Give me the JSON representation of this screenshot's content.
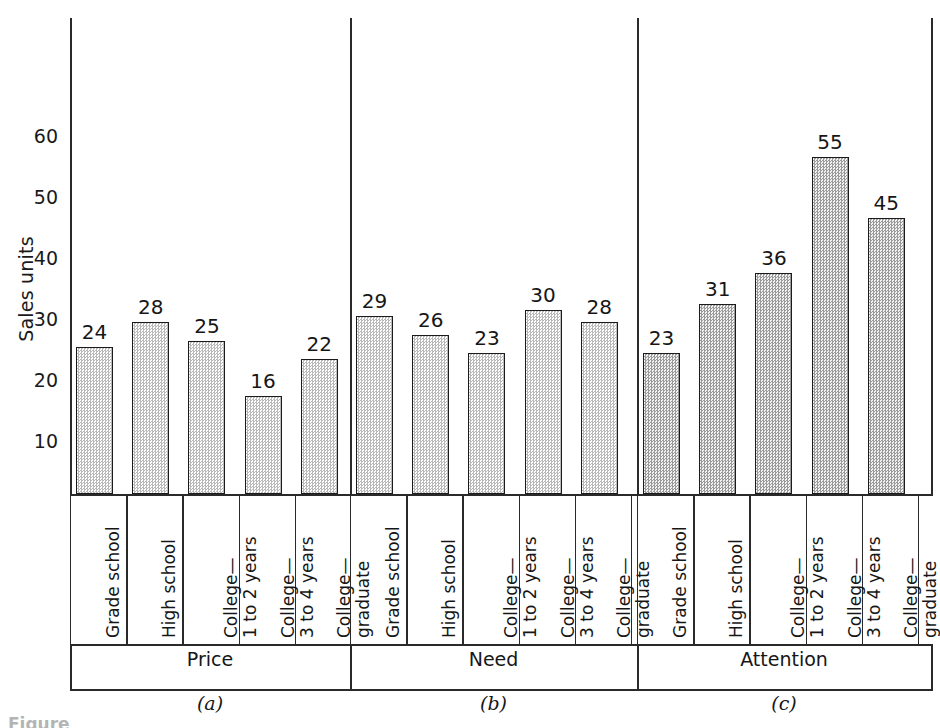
{
  "chart_data": {
    "type": "bar",
    "title": "",
    "xlabel": "",
    "ylabel": "Sales units",
    "ylim": [
      0,
      68
    ],
    "ytick_values": [
      10,
      20,
      30,
      40,
      50,
      60
    ],
    "ytick_labels": [
      "10",
      "20",
      "30",
      "40",
      "50",
      "60"
    ],
    "grid": false,
    "legend": "none",
    "value_labels": true,
    "categories": [
      "Grade school",
      "High school",
      "College— 1 to 2 years",
      "College— 3 to 4 years",
      "College— graduate"
    ],
    "panels": [
      {
        "tag": "(a)",
        "name": "Price",
        "values": [
          24,
          28,
          25,
          16,
          22
        ],
        "shade": "light"
      },
      {
        "tag": "(b)",
        "name": "Need",
        "values": [
          29,
          26,
          23,
          30,
          28
        ],
        "shade": "light"
      },
      {
        "tag": "(c)",
        "name": "Attention",
        "values": [
          23,
          31,
          36,
          55,
          45
        ],
        "shade": "dark"
      }
    ]
  },
  "axis": {
    "y_title": "Sales units",
    "ticks": [
      {
        "label": "60"
      },
      {
        "label": "50"
      },
      {
        "label": "40"
      },
      {
        "label": "30"
      },
      {
        "label": "20"
      },
      {
        "label": "10"
      }
    ]
  },
  "categories": [
    {
      "line1": "Grade school",
      "line2": ""
    },
    {
      "line1": "High school",
      "line2": ""
    },
    {
      "line1": "College—",
      "line2": "1 to 2 years"
    },
    {
      "line1": "College—",
      "line2": "3 to 4 years"
    },
    {
      "line1": "College—",
      "line2": "graduate"
    }
  ],
  "panels": [
    {
      "name": "Price",
      "tag": "(a)",
      "bars": [
        {
          "value": "24"
        },
        {
          "value": "28"
        },
        {
          "value": "25"
        },
        {
          "value": "16"
        },
        {
          "value": "22"
        }
      ]
    },
    {
      "name": "Need",
      "tag": "(b)",
      "bars": [
        {
          "value": "29"
        },
        {
          "value": "26"
        },
        {
          "value": "23"
        },
        {
          "value": "30"
        },
        {
          "value": "28"
        }
      ]
    },
    {
      "name": "Attention",
      "tag": "(c)",
      "bars": [
        {
          "value": "23"
        },
        {
          "value": "31"
        },
        {
          "value": "36"
        },
        {
          "value": "55"
        },
        {
          "value": "45"
        }
      ]
    }
  ],
  "caption": "Figure",
  "colors": {
    "ink": "#1b1b1b",
    "bar_light": "#e3e3e3",
    "bar_dark": "#cfcfcf"
  }
}
